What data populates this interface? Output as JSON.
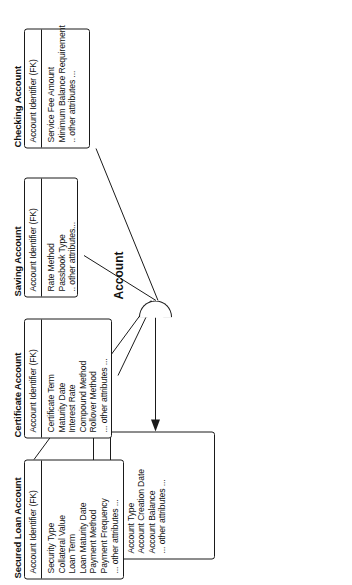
{
  "diagram": {
    "type": "er-subtype-diagram",
    "orientation": "rotated-90-ccw",
    "discriminator_label": "Account",
    "line_color": "#1a1a1a",
    "background": "#ffffff"
  },
  "supertype": {
    "title": "Account",
    "primary_key": "Account Identifier",
    "attributes": [
      "Account Owner Identifier",
      "Account Type",
      "Account Creation Date",
      "Account Balance",
      "... other attributes ..."
    ]
  },
  "subtypes": [
    {
      "title": "Checking Account",
      "primary_key": "Account Identifier (FK)",
      "attributes": [
        "Service Fee Amount",
        "Minimum Balance Requirement",
        ".. other attributes ..."
      ]
    },
    {
      "title": "Saving Account",
      "primary_key": "Account Identifier (FK)",
      "attributes": [
        "Rate Method",
        "Passbook Type",
        ".. other attributes..."
      ]
    },
    {
      "title": "Certificate Account",
      "primary_key": "Account Identifier (FK)",
      "attributes": [
        "Certificate Term",
        "Maturity Date",
        "Interest Rate",
        "Compound Method",
        "Rollover Method",
        "... other attributes ..."
      ]
    },
    {
      "title": "Secured Loan Account",
      "primary_key": "Account Identifier (FK)",
      "attributes": [
        "Security Type",
        "Collateral Value",
        "Loan Term",
        "Loan Maturity Date",
        "Payment Method",
        "Payment Frequency",
        "... other attributes ..."
      ]
    }
  ]
}
